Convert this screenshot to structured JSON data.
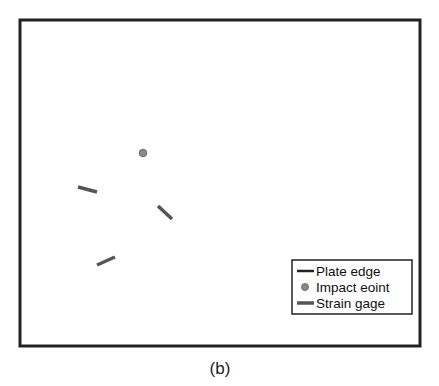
{
  "figure": {
    "caption": "(b)",
    "plate": {
      "x": 20,
      "y": 20,
      "width": 400,
      "height": 326,
      "stroke": "#222222"
    },
    "impact_point": {
      "cx": 143,
      "cy": 153,
      "r": 3.8,
      "fill": "#8a8a8a",
      "stroke": "#5a5a5a"
    },
    "strain_gages": [
      {
        "x1": 78,
        "y1": 187,
        "x2": 97,
        "y2": 192
      },
      {
        "x1": 158,
        "y1": 206,
        "x2": 172,
        "y2": 219
      },
      {
        "x1": 97,
        "y1": 265,
        "x2": 115,
        "y2": 257
      }
    ],
    "gage_color": "#555555"
  },
  "legend": {
    "items": [
      {
        "label": "Plate edge",
        "symbol": "line-dark"
      },
      {
        "label": "Impact eoint",
        "symbol": "dot-gray"
      },
      {
        "label": "Strain gage",
        "symbol": "line-gray"
      }
    ]
  }
}
